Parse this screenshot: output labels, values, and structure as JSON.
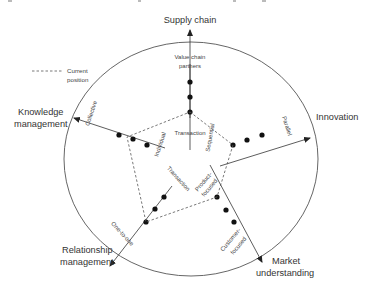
{
  "caption_fragment": "g                                                          ,     g",
  "legend": {
    "line_style": "dashed",
    "label_line1": "Current",
    "label_line2": "position"
  },
  "axes": [
    {
      "id": "supply-chain",
      "outer_label": [
        "Supply chain"
      ],
      "inner_label": [
        "Value chain",
        "partners"
      ],
      "center_label": [
        "Transaction"
      ]
    },
    {
      "id": "innovation",
      "outer_label": [
        "Innovation"
      ],
      "inner_label": [
        "Parallel"
      ],
      "center_label": [
        "Sequential"
      ]
    },
    {
      "id": "market-understanding",
      "outer_label": [
        "Market",
        "understanding"
      ],
      "inner_label": [
        "Customer-",
        "focused"
      ],
      "center_label": [
        "Product-",
        "focused"
      ]
    },
    {
      "id": "relationship-management",
      "outer_label": [
        "Relationship",
        "management"
      ],
      "inner_label": [
        "One-to-one"
      ],
      "center_label": [
        "Transaction"
      ]
    },
    {
      "id": "knowledge-management",
      "outer_label": [
        "Knowledge",
        "management"
      ],
      "inner_label": [
        "Collective"
      ],
      "center_label": [
        "Individual"
      ]
    }
  ],
  "colors": {
    "line": "#333333",
    "circle": "#555555",
    "dashed": "#555555",
    "dot": "#111111",
    "text": "#333333"
  }
}
